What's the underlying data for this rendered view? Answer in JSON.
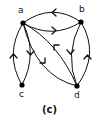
{
  "figure": {
    "caption": "(c)",
    "nodes": [
      {
        "id": "a",
        "label": "a"
      },
      {
        "id": "b",
        "label": "b"
      },
      {
        "id": "c",
        "label": "c"
      },
      {
        "id": "d",
        "label": "d"
      }
    ],
    "edges": [
      {
        "from": "b",
        "to": "a"
      },
      {
        "from": "a",
        "to": "b"
      },
      {
        "from": "c",
        "to": "a"
      },
      {
        "from": "a",
        "to": "c"
      },
      {
        "from": "a",
        "to": "d"
      },
      {
        "from": "d",
        "to": "a"
      },
      {
        "from": "b",
        "to": "d"
      },
      {
        "from": "d",
        "to": "b"
      }
    ],
    "colors": {
      "stroke": "#111111",
      "background": "#ffffff"
    }
  }
}
